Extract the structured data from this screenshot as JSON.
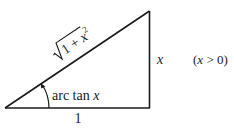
{
  "diagram": {
    "type": "right-triangle",
    "hypotenuse_label": {
      "radicand_prefix": "1 + ",
      "variable": "x",
      "exponent": "2"
    },
    "opposite_label": "x",
    "adjacent_label": "1",
    "angle_label": {
      "prefix": "arc tan ",
      "variable": "x"
    },
    "condition_label": {
      "open": "(",
      "variable": "x",
      "rest": " > 0)"
    },
    "colors": {
      "stroke": "#1a1a1a",
      "background": "#ffffff"
    }
  }
}
